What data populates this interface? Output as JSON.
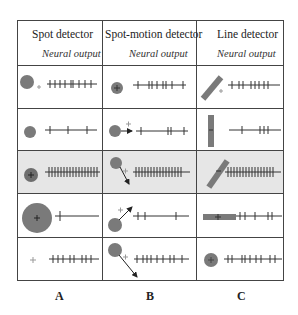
{
  "columns": [
    {
      "title": "Spot detector",
      "subtitle": "Neural output",
      "label": "A"
    },
    {
      "title": "Spot-motion detector",
      "subtitle": "Neural output",
      "label": "B"
    },
    {
      "title": "Line detector",
      "subtitle": "Neural output",
      "label": "C"
    }
  ],
  "rows": [
    {
      "A": "small spot offset from receptive field center; moderate spikes",
      "B": "spot at center; moderate spikes",
      "C": "diagonal bar offset; moderate spikes"
    },
    {
      "A": "spot at edge; few spikes",
      "B": "spot moving right away; few spikes",
      "C": "vertical bar; few spikes"
    },
    {
      "A": "spot on center; many spikes (preferred)",
      "B": "spot moving down-right through center; many spikes (preferred)",
      "C": "diagonal bar through center; many spikes (preferred)"
    },
    {
      "A": "large spot covering center; one spike",
      "B": "spot moving up-right; few spikes",
      "C": "horizontal bar; moderate spikes"
    },
    {
      "A": "no stimulus; baseline spikes",
      "B": "spot moving down-right away; baseline spikes",
      "C": "spot at center; baseline spikes"
    }
  ],
  "highlight_row": 3,
  "colors": {
    "stimulus": "#7a7a7a",
    "shade": "#e6e6e6",
    "line": "#444444"
  }
}
